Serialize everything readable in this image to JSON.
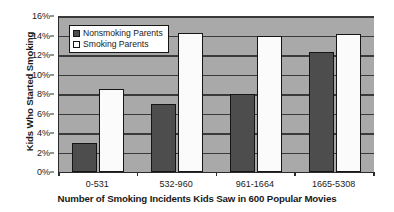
{
  "chart_data": {
    "type": "bar",
    "title": "",
    "xlabel": "Number of Smoking Incidents Kids Saw in 600 Popular Movies",
    "ylabel": "Kids Who Started Smoking",
    "categories": [
      "0-531",
      "532-960",
      "961-1664",
      "1665-5308"
    ],
    "series": [
      {
        "name": "Nonsmoking Parents",
        "color": "#4d4d4d",
        "values": [
          3.0,
          7.0,
          8.0,
          12.3
        ]
      },
      {
        "name": "Smoking Parents",
        "color": "#fbfbfb",
        "values": [
          8.5,
          14.3,
          13.9,
          14.2
        ]
      }
    ],
    "ylim": [
      0,
      16
    ],
    "ytick_step": 2,
    "ytick_labels": [
      "0%",
      "2%",
      "4%",
      "6%",
      "8%",
      "10%",
      "12%",
      "14%",
      "16%"
    ],
    "ytick_values": [
      0,
      2,
      4,
      6,
      8,
      10,
      12,
      14,
      16
    ],
    "grid": true,
    "grid_axis": "y",
    "legend_position": "top-left-inside",
    "plot_background": "#a9a9a9",
    "figure_background": "#ffffff"
  },
  "legend": {
    "items": [
      {
        "label": "Nonsmoking Parents"
      },
      {
        "label": "Smoking Parents"
      }
    ]
  }
}
